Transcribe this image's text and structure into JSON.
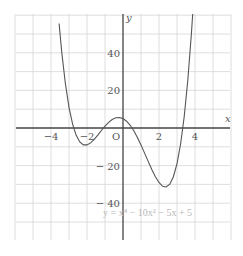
{
  "chart_data": {
    "type": "line",
    "title": "",
    "xlabel": "x",
    "ylabel": "y",
    "xlim": [
      -6,
      6
    ],
    "ylim": [
      -60,
      60
    ],
    "grid": true,
    "x_grid_step": 1,
    "y_grid_step": 10,
    "x_tick_labels": [
      {
        "value": -4,
        "label": "−4"
      },
      {
        "value": -2,
        "label": "−2"
      },
      {
        "value": 0,
        "label": "O"
      },
      {
        "value": 2,
        "label": "2"
      },
      {
        "value": 4,
        "label": "4"
      }
    ],
    "y_tick_labels": [
      {
        "value": 40,
        "label": "40"
      },
      {
        "value": 20,
        "label": "20"
      },
      {
        "value": -20,
        "label": "− 20"
      },
      {
        "value": -40,
        "label": "− 40"
      }
    ],
    "annotation": "y = x⁴ − 10x² − 5x + 5",
    "series": [
      {
        "name": "y = x^4 - 10x^2 - 5x + 5",
        "x": [
          -3.55,
          -3.4,
          -3.2,
          -3.0,
          -2.8,
          -2.6,
          -2.4,
          -2.2,
          -2.0,
          -1.8,
          -1.6,
          -1.4,
          -1.2,
          -1.0,
          -0.8,
          -0.6,
          -0.4,
          -0.2,
          0,
          0.2,
          0.4,
          0.6,
          0.8,
          1.0,
          1.2,
          1.4,
          1.6,
          1.8,
          2.0,
          2.2,
          2.4,
          2.6,
          2.8,
          3.0,
          3.2,
          3.4,
          3.6,
          3.8,
          3.9
        ],
        "y": [
          55.6,
          40.0,
          23.5,
          11.0,
          2.1,
          -3.9,
          -7.4,
          -9.0,
          -9.0,
          -7.9,
          -6.05,
          -3.76,
          -1.33,
          1.0,
          3.01,
          4.53,
          5.43,
          5.6,
          5.0,
          3.6,
          1.43,
          -1.47,
          -4.99,
          -9.0,
          -13.33,
          -17.76,
          -22.05,
          -25.9,
          -29.0,
          -31.0,
          -31.4,
          -29.9,
          -25.9,
          -19.0,
          -8.5,
          6.0,
          25.4,
          50.1,
          64.7
        ]
      }
    ]
  },
  "colors": {
    "grid": "#d6d6d6",
    "axis": "#444444",
    "curve": "#555555",
    "text": "#555555",
    "annotation": "#b8b8b8"
  }
}
